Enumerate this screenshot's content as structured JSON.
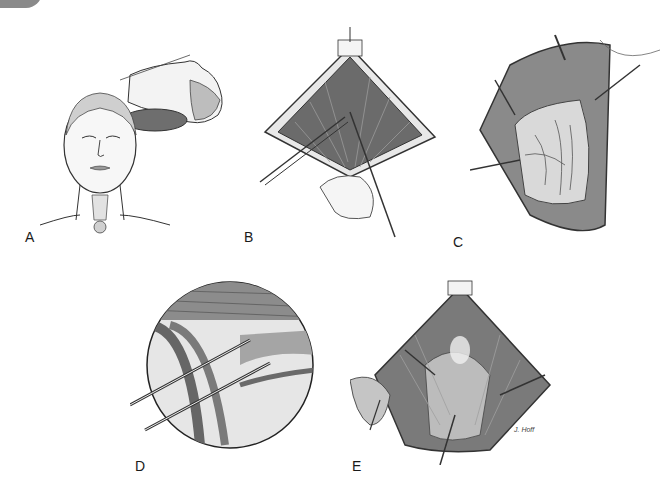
{
  "figure": {
    "panels": [
      {
        "id": "A",
        "label": "A",
        "description": "patient positioned supine with neck extended over shoulder roll; frontal view of face with thyroid cartilage outline"
      },
      {
        "id": "B",
        "label": "B",
        "description": "diamond-shaped incision with strap muscles divided along midline using forceps"
      },
      {
        "id": "C",
        "label": "C",
        "description": "retracted strap muscles exposing thyroid lobe with vessels"
      },
      {
        "id": "D",
        "label": "D",
        "description": "circular magnified inset: clamps placed across superior thyroid vessels"
      },
      {
        "id": "E",
        "label": "E",
        "description": "thyroid lobe mobilized and reflected with retractors in place"
      }
    ],
    "signature": "J. Hoff",
    "colors": {
      "background": "#ffffff",
      "ink": "#1a1a1a",
      "muscle_dark": "#5a5a5a",
      "muscle_mid": "#8c8c8c",
      "tissue_light": "#d8d8d8",
      "pillow": "#6e6e6e"
    }
  }
}
